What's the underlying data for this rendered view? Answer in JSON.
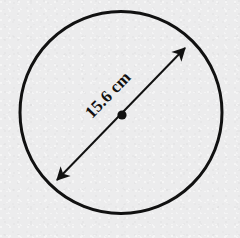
{
  "figure": {
    "kind": "geometry-diagram",
    "shape_name": "circle",
    "background_color": "#ececed",
    "ink_color": "#111111",
    "canvas": {
      "width": 240,
      "height": 238
    },
    "circle": {
      "center_x": 121,
      "center_y": 112.5,
      "radius": 101,
      "stroke_width": 3
    },
    "center_point": {
      "label": "center-dot",
      "x": 122,
      "y": 115,
      "radius": 4.6
    },
    "diameter_arrow": {
      "label": "15.6 cm",
      "value": "15.6",
      "unit": "cm",
      "start_x": 57,
      "start_y": 180,
      "end_x": 185,
      "end_y": 48,
      "stroke_width": 2,
      "arrowheads": "both",
      "angle_degrees": -45.9,
      "label_x": 109,
      "label_y": 96,
      "label_rotation": -45.9
    }
  }
}
